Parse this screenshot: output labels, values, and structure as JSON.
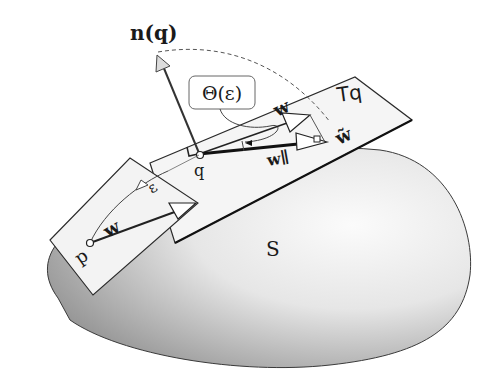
{
  "figure": {
    "labels": {
      "normal": "n(q)",
      "theta": "Θ(ε)",
      "tangent_plane": "Tq",
      "surface": "S",
      "point_p": "p",
      "point_q": "q",
      "vector_w_p": "w",
      "vector_w_q": "w",
      "vector_w_parallel": "w∥",
      "vector_w_tilde": "w̃",
      "epsilon": "ε"
    },
    "colors": {
      "surface_dark": "#8a8a8a",
      "surface_light": "#f2f2f2",
      "plane_fill": "#f4f4f4",
      "stroke": "#1a1a1a",
      "arrow_fill": "#ffffff",
      "normal_arrow_fill": "#d8d8d8"
    }
  }
}
